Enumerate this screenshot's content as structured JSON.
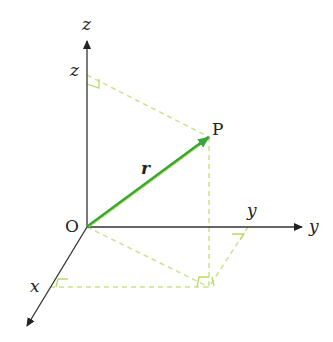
{
  "diagram": {
    "type": "3d-position-vector",
    "colors": {
      "axes": "#333333",
      "vector": "#3aa63a",
      "vector_highlight": "#b8e34a",
      "construction": "#c9e58a"
    },
    "labels": {
      "z_axis": "z",
      "z_tick": "z",
      "y_axis": "y",
      "y_tick": "y",
      "x_axis": "x",
      "origin": "O",
      "point": "P",
      "vector": "r"
    }
  }
}
